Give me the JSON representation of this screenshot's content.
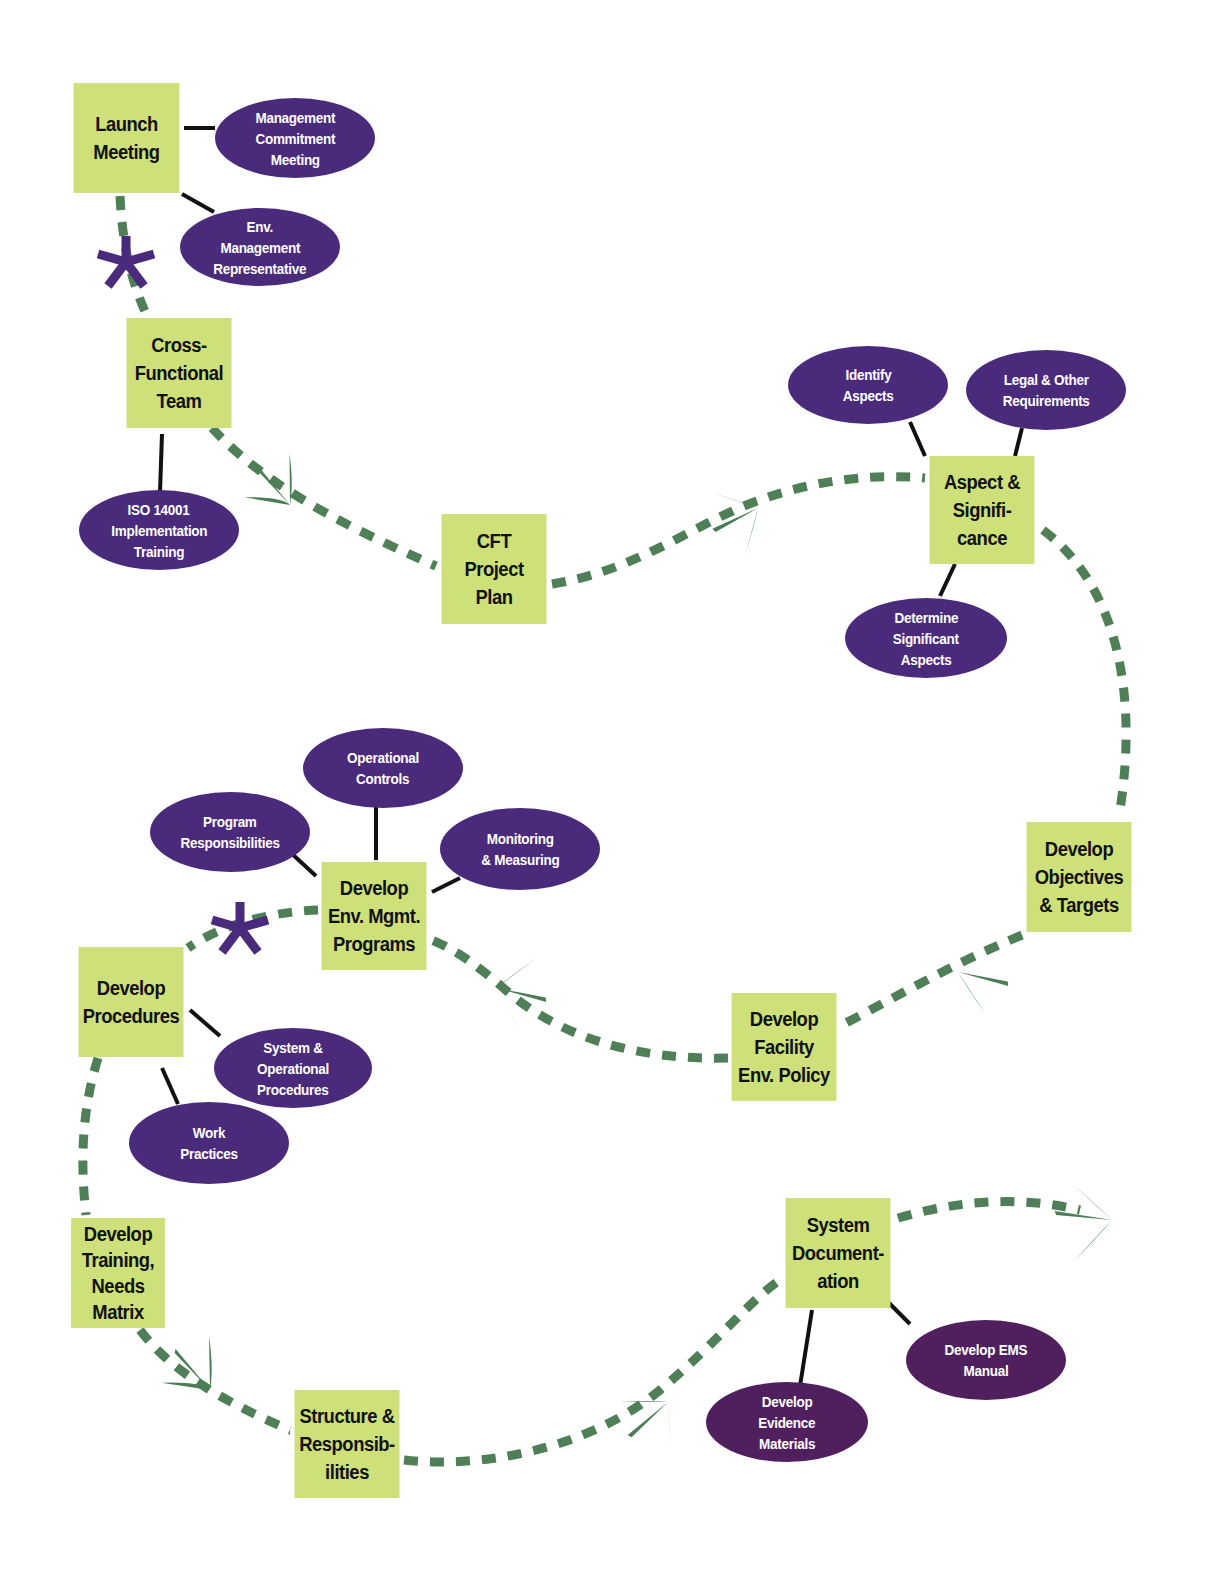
{
  "colors": {
    "box_fill": "#cde07a",
    "oval_fill": "#4a2a7a",
    "oval_fill_dark": "#4f1f5e",
    "path_dash": "#4e7f57",
    "arrow_fill": "#4a7d55",
    "connector": "#111111",
    "asterisk": "#4a2a7a"
  },
  "steps": [
    {
      "id": "launch",
      "lines": [
        "Launch",
        "Meeting"
      ]
    },
    {
      "id": "cft",
      "lines": [
        "Cross-",
        "Functional",
        "Team"
      ]
    },
    {
      "id": "plan",
      "lines": [
        "CFT",
        "Project",
        "Plan"
      ]
    },
    {
      "id": "aspect",
      "lines": [
        "Aspect &",
        "Signifi-",
        "cance"
      ]
    },
    {
      "id": "objectives",
      "lines": [
        "Develop",
        "Objectives",
        "& Targets"
      ]
    },
    {
      "id": "policy",
      "lines": [
        "Develop",
        "Facility",
        "Env. Policy"
      ]
    },
    {
      "id": "programs",
      "lines": [
        "Develop",
        "Env. Mgmt.",
        "Programs"
      ]
    },
    {
      "id": "procedures",
      "lines": [
        "Develop",
        "Procedures"
      ]
    },
    {
      "id": "training",
      "lines": [
        "Develop",
        "Training,",
        "Needs",
        "Matrix"
      ]
    },
    {
      "id": "structure",
      "lines": [
        "Structure &",
        "Responsib-",
        "ilities"
      ]
    },
    {
      "id": "documentation",
      "lines": [
        "System",
        "Document-",
        "ation"
      ]
    }
  ],
  "subtasks": [
    {
      "id": "mgmt-commitment",
      "parent": "launch",
      "lines": [
        "Management",
        "Commitment",
        "Meeting"
      ]
    },
    {
      "id": "env-rep",
      "parent": "launch",
      "lines": [
        "Env.",
        "Management",
        "Representative"
      ]
    },
    {
      "id": "iso-training",
      "parent": "cft",
      "lines": [
        "ISO 14001",
        "Implementation",
        "Training"
      ]
    },
    {
      "id": "identify-aspects",
      "parent": "aspect",
      "lines": [
        "Identify",
        "Aspects"
      ]
    },
    {
      "id": "legal",
      "parent": "aspect",
      "lines": [
        "Legal & Other",
        "Requirements"
      ]
    },
    {
      "id": "determine-significant",
      "parent": "aspect",
      "lines": [
        "Determine",
        "Significant",
        "Aspects"
      ]
    },
    {
      "id": "operational-controls",
      "parent": "programs",
      "lines": [
        "Operational",
        "Controls"
      ]
    },
    {
      "id": "program-responsibilities",
      "parent": "programs",
      "lines": [
        "Program",
        "Responsibilities"
      ]
    },
    {
      "id": "monitoring",
      "parent": "programs",
      "lines": [
        "Monitoring",
        "& Measuring"
      ]
    },
    {
      "id": "system-procedures",
      "parent": "procedures",
      "lines": [
        "System &",
        "Operational",
        "Procedures"
      ]
    },
    {
      "id": "work-practices",
      "parent": "procedures",
      "lines": [
        "Work",
        "Practices"
      ]
    },
    {
      "id": "evidence",
      "parent": "documentation",
      "lines": [
        "Develop",
        "Evidence",
        "Materials"
      ]
    },
    {
      "id": "ems-manual",
      "parent": "documentation",
      "lines": [
        "Develop EMS",
        "Manual"
      ]
    }
  ],
  "markers": [
    {
      "id": "asterisk-1",
      "symbol": "*",
      "near": "launch-to-cft"
    },
    {
      "id": "asterisk-2",
      "symbol": "*",
      "near": "programs-to-procedures"
    }
  ]
}
